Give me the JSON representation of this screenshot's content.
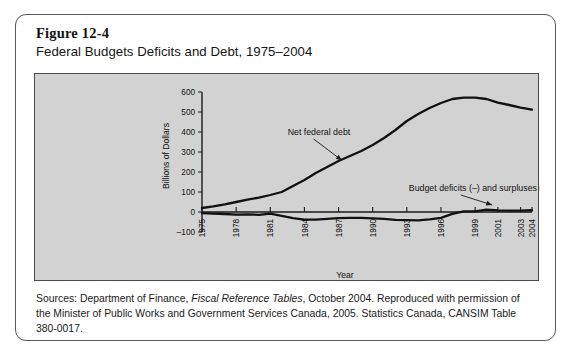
{
  "figure": {
    "number": "Figure 12-4",
    "title": "Federal Budgets Deficits and Debt, 1975–2004"
  },
  "source": {
    "prefix": "Sources: Department of Finance, ",
    "italic_title": "Fiscal Reference Tables",
    "suffix": ", October 2004. Reproduced with permission of the Minister of Public Works and Government Services Canada, 2005. Statistics Canada, CANSIM Table 380-0017."
  },
  "colors": {
    "panel_background": "#d2d2d2",
    "card_border": "#5a5a5a",
    "line": "#111111",
    "text": "#151515"
  },
  "chart_data": {
    "type": "line",
    "title": "Federal Budgets Deficits and Debt, 1975–2004",
    "xlabel": "Year",
    "ylabel": "Billions of Dollars",
    "ylim": [
      -100,
      600
    ],
    "yticks": [
      -100,
      0,
      100,
      200,
      300,
      400,
      500,
      600
    ],
    "ytick_labels": [
      "–100",
      "0",
      "100",
      "200",
      "300",
      "400",
      "500",
      "600"
    ],
    "xlim": [
      1975,
      2004
    ],
    "xticks": [
      1975,
      1978,
      1981,
      1984,
      1987,
      1990,
      1993,
      1996,
      1999,
      2001,
      2003,
      2004
    ],
    "xtick_labels": [
      "1975",
      "1978",
      "1981",
      "1984",
      "1987",
      "1990",
      "1993",
      "1996",
      "1999",
      "2001",
      "2003",
      "2004"
    ],
    "grid": false,
    "legend": "none",
    "x": [
      1975,
      1976,
      1977,
      1978,
      1979,
      1980,
      1981,
      1982,
      1983,
      1984,
      1985,
      1986,
      1987,
      1988,
      1989,
      1990,
      1991,
      1992,
      1993,
      1994,
      1995,
      1996,
      1997,
      1998,
      1999,
      2000,
      2001,
      2002,
      2003,
      2004
    ],
    "series": [
      {
        "name": "Net federal debt",
        "annotation": "Net federal debt",
        "values": [
          20,
          28,
          38,
          50,
          62,
          72,
          85,
          100,
          130,
          160,
          195,
          225,
          255,
          280,
          305,
          335,
          370,
          410,
          455,
          490,
          520,
          545,
          565,
          572,
          572,
          565,
          547,
          535,
          522,
          512
        ]
      },
      {
        "name": "Budget deficits (–) and surpluses (+)",
        "annotation": "Budget deficits (–) and surpluses (+)",
        "values": [
          -6,
          -8,
          -10,
          -13,
          -12,
          -14,
          -8,
          -19,
          -31,
          -38,
          -38,
          -34,
          -31,
          -29,
          -29,
          -32,
          -34,
          -39,
          -41,
          -42,
          -37,
          -29,
          -9,
          3,
          3,
          12,
          8,
          7,
          7,
          9
        ]
      }
    ],
    "annotations": [
      {
        "text": "Net federal debt",
        "x": 1982,
        "y": 430
      },
      {
        "text": "Budget deficits (–) and surpluses (+)",
        "x": 1993,
        "y": 120
      }
    ]
  }
}
